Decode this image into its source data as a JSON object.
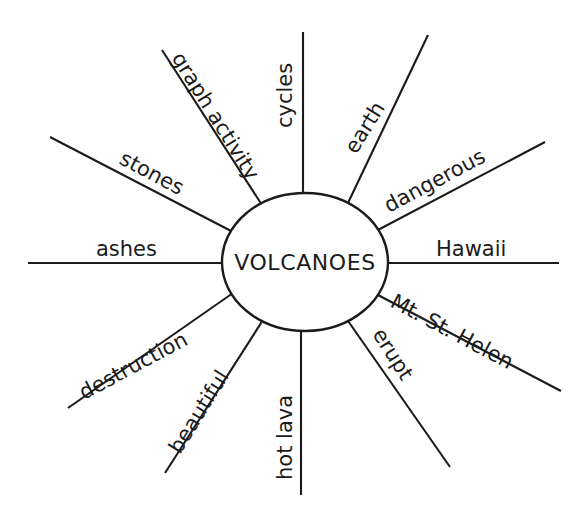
{
  "diagram": {
    "type": "word-web",
    "title": "VOLCANOES",
    "center": {
      "label": "VOLCANOES",
      "shape": "ellipse",
      "cx": 305,
      "cy": 262,
      "rx": 83,
      "ry": 69
    },
    "stroke_color": "#1b1b1b",
    "background_color": "#ffffff",
    "spoke_count": 12,
    "spokes": [
      {
        "id": "cycles",
        "label": "cycles",
        "angle_deg": -90,
        "text_rotation_deg": -90,
        "x1": 303,
        "y1": 193,
        "x2": 303,
        "y2": 32,
        "tx": 292,
        "ty": 128,
        "anchor": "start"
      },
      {
        "id": "earth",
        "label": "earth",
        "angle_deg": -58,
        "text_rotation_deg": -58,
        "x1": 347,
        "y1": 205,
        "x2": 428,
        "y2": 35,
        "tx": 356,
        "ty": 155,
        "anchor": "start"
      },
      {
        "id": "dangerous",
        "label": "dangerous",
        "angle_deg": -28,
        "text_rotation_deg": -28,
        "x1": 376,
        "y1": 231,
        "x2": 545,
        "y2": 142,
        "tx": 389,
        "ty": 213,
        "anchor": "start"
      },
      {
        "id": "hawaii",
        "label": "Hawaii",
        "angle_deg": 0,
        "text_rotation_deg": 0,
        "x1": 388,
        "y1": 263,
        "x2": 559,
        "y2": 263,
        "tx": 436,
        "ty": 256,
        "anchor": "start"
      },
      {
        "id": "mt-st-helen",
        "label": "Mt. St. Helen",
        "angle_deg": 28,
        "text_rotation_deg": 28,
        "x1": 376,
        "y1": 294,
        "x2": 561,
        "y2": 391,
        "tx": 389,
        "ty": 306,
        "anchor": "start"
      },
      {
        "id": "erupt",
        "label": "erupt",
        "angle_deg": 58,
        "text_rotation_deg": 58,
        "x1": 346,
        "y1": 318,
        "x2": 450,
        "y2": 467,
        "tx": 372,
        "ty": 334,
        "anchor": "start"
      },
      {
        "id": "hot-lava",
        "label": "hot lava",
        "angle_deg": 90,
        "text_rotation_deg": -90,
        "x1": 301,
        "y1": 331,
        "x2": 301,
        "y2": 495,
        "tx": 292,
        "ty": 480,
        "anchor": "start"
      },
      {
        "id": "beautiful",
        "label": "beautiful",
        "angle_deg": 122,
        "text_rotation_deg": -58,
        "x1": 263,
        "y1": 320,
        "x2": 165,
        "y2": 473,
        "tx": 180,
        "ty": 455,
        "anchor": "start"
      },
      {
        "id": "destruction",
        "label": "destruction",
        "angle_deg": 152,
        "text_rotation_deg": -28,
        "x1": 233,
        "y1": 293,
        "x2": 68,
        "y2": 408,
        "tx": 84,
        "ty": 400,
        "anchor": "start"
      },
      {
        "id": "ashes",
        "label": "ashes",
        "angle_deg": 180,
        "text_rotation_deg": 0,
        "x1": 222,
        "y1": 263,
        "x2": 28,
        "y2": 263,
        "tx": 96,
        "ty": 256,
        "anchor": "start"
      },
      {
        "id": "stones",
        "label": "stones",
        "angle_deg": -152,
        "text_rotation_deg": 28,
        "x1": 233,
        "y1": 232,
        "x2": 50,
        "y2": 137,
        "tx": 118,
        "ty": 163,
        "anchor": "start"
      },
      {
        "id": "graph-activity",
        "label": "graph activity",
        "angle_deg": -122,
        "text_rotation_deg": 58,
        "x1": 262,
        "y1": 205,
        "x2": 162,
        "y2": 50,
        "tx": 171,
        "ty": 58,
        "anchor": "start"
      }
    ]
  }
}
